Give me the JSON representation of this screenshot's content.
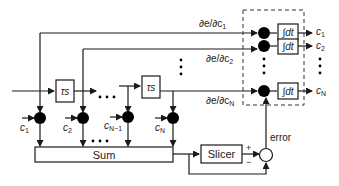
{
  "diagram": {
    "blocks": {
      "delay_1": "τs",
      "delay_2": "τs",
      "sum": "Sum",
      "slicer": "Slicer",
      "integrator_1": "∫dt",
      "integrator_2": "∫dt",
      "integrator_N": "∫dt"
    },
    "coefficient_inputs": {
      "c1": "c",
      "c1_sub": "1",
      "c2": "c",
      "c2_sub": "2",
      "cNm1": "c",
      "cNm1_sub": "N−1",
      "cN": "c",
      "cN_sub": "N"
    },
    "gradient_labels": {
      "g1": "∂e/∂c",
      "g1_sub": "1",
      "g2": "∂e/∂c",
      "g2_sub": "2",
      "gN": "∂e/∂c",
      "gN_sub": "N"
    },
    "outputs": {
      "o1": "c",
      "o1_sub": "1",
      "o2": "c",
      "o2_sub": "2",
      "oN": "c",
      "oN_sub": "N"
    },
    "error_label": "error",
    "plus_sign": "+",
    "minus_sign": "−",
    "ellipsis": "• • •",
    "colors": {
      "line": "#1a1a1a",
      "node": "#000000",
      "dashed_box": "#333333"
    }
  }
}
